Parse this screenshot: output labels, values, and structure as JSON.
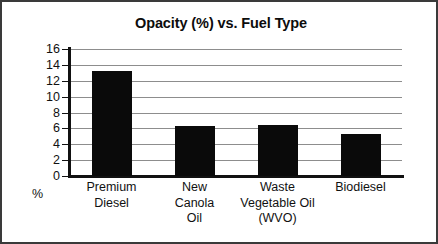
{
  "chart_data": {
    "type": "bar",
    "title": "Opacity (%) vs. Fuel Type",
    "xlabel": "",
    "ylabel": "%",
    "ylim": [
      0,
      16
    ],
    "ytick_step": 2,
    "yticks": [
      0,
      2,
      4,
      6,
      8,
      10,
      12,
      14,
      16
    ],
    "grid": true,
    "legend": false,
    "categories": [
      "Premium Diesel",
      "New Canola Oil",
      "Waste Vegetable Oil (WVO)",
      "Biodiesel"
    ],
    "category_lines": [
      [
        "Premium",
        "Diesel"
      ],
      [
        "New",
        "Canola",
        "Oil"
      ],
      [
        "Waste",
        "Vegetable Oil",
        "(WVO)"
      ],
      [
        "Biodiesel"
      ]
    ],
    "values": [
      13.25,
      6.3,
      6.4,
      5.35
    ],
    "bar_color": "#0a0a0a",
    "grid_color": "#8d8d8d",
    "axis_color": "#111111",
    "background": "#ffffff",
    "border_color": "#3a3a3a"
  }
}
